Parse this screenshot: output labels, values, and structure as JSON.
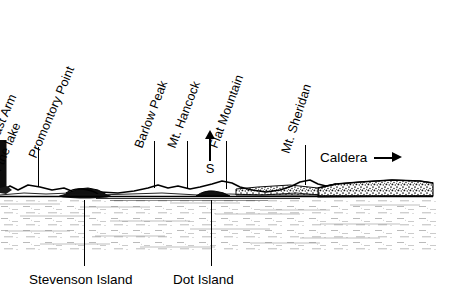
{
  "figure": {
    "background_color": "#ffffff",
    "ink_color": "#000000",
    "width": 460,
    "height": 303
  },
  "peak_labels": [
    {
      "id": "southeast-arm",
      "line1": "Southeast Arm",
      "line2": "of the lake",
      "x": 4,
      "y": 150,
      "angle": -67,
      "clipped_left": true
    },
    {
      "id": "promontory-point",
      "line1": "Promontory Point",
      "line2": "",
      "x": 38,
      "y": 148,
      "angle": -67
    },
    {
      "id": "barlow-peak",
      "line1": "Barlow Peak",
      "line2": "",
      "x": 145,
      "y": 137,
      "angle": -69
    },
    {
      "id": "mt-hancock",
      "line1": "Mt. Hancock",
      "line2": "",
      "x": 178,
      "y": 137,
      "angle": -69
    },
    {
      "id": "flat-mountain",
      "line1": "Flat Mountain",
      "line2": "",
      "x": 221,
      "y": 137,
      "angle": -70
    },
    {
      "id": "mt-sheridan",
      "line1": "Mt. Sheridan",
      "line2": "",
      "x": 292,
      "y": 142,
      "angle": -72
    }
  ],
  "leader_lines": [
    {
      "id": "leader-promontory-point",
      "x": 38,
      "y_top": 147,
      "y_bottom": 186
    },
    {
      "id": "leader-barlow-peak",
      "x": 154,
      "y_top": 141,
      "y_bottom": 188
    },
    {
      "id": "leader-mt-hancock",
      "x": 187,
      "y_top": 141,
      "y_bottom": 189
    },
    {
      "id": "leader-flat-mountain",
      "x": 226,
      "y_top": 141,
      "y_bottom": 189
    },
    {
      "id": "leader-mt-sheridan",
      "x": 305,
      "y_top": 145,
      "y_bottom": 185
    },
    {
      "id": "leader-stevenson-island",
      "x": 84,
      "y_top": 198,
      "y_bottom": 268
    },
    {
      "id": "leader-dot-island",
      "x": 211,
      "y_top": 198,
      "y_bottom": 268
    }
  ],
  "bottom_labels": [
    {
      "id": "stevenson-island",
      "text": "Stevenson Island",
      "x": 29,
      "y": 272
    },
    {
      "id": "dot-island",
      "text": "Dot Island",
      "x": 173,
      "y": 272
    }
  ],
  "caldera": {
    "text": "Caldera",
    "arrow_icon": "arrow-right-icon",
    "direction": "right"
  },
  "compass": {
    "letter": "S",
    "arrow_icon": "arrow-up-icon",
    "direction": "up",
    "meaning": "South"
  },
  "scene": {
    "sky_color": "#ffffff",
    "ridge_color": "#000000",
    "water_color": "#ffffff",
    "stipple_color": "#555555",
    "horizon_y": 196,
    "features": [
      "left-edge-dark-headland",
      "low-shoreline-ridge",
      "stevenson-island-dark-mass",
      "flat-mountain-rise",
      "mt-sheridan-rise",
      "caldera-rim-stippled-bluff",
      "stippled-lake-surface"
    ]
  }
}
